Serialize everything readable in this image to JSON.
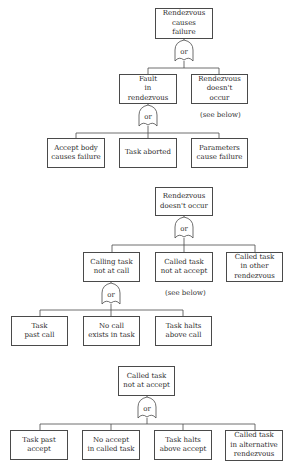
{
  "trees": [
    {
      "id": "rendezvous-causes-failure",
      "root": {
        "lines": [
          "Rendezvous",
          "causes",
          "failure"
        ]
      },
      "gate": {
        "type": "or",
        "label": "or"
      },
      "children": [
        {
          "lines": [
            "Fault",
            "in",
            "rendezvous"
          ],
          "gate": {
            "type": "or",
            "label": "or"
          },
          "children": [
            {
              "lines": [
                "Accept body",
                "causes failure"
              ]
            },
            {
              "lines": [
                "Task aborted"
              ]
            },
            {
              "lines": [
                "Parameters",
                "cause failure"
              ]
            }
          ]
        },
        {
          "lines": [
            "Rendezvous",
            "doesn't",
            "occur"
          ],
          "note": "(see below)"
        }
      ]
    },
    {
      "id": "rendezvous-doesnt-occur",
      "root": {
        "lines": [
          "Rendezvous",
          "doesn't occur"
        ]
      },
      "gate": {
        "type": "or",
        "label": "or"
      },
      "children": [
        {
          "lines": [
            "Calling task",
            "not at call"
          ],
          "gate": {
            "type": "or",
            "label": "or"
          },
          "children": [
            {
              "lines": [
                "Task",
                "past call"
              ]
            },
            {
              "lines": [
                "No call",
                "exists in task"
              ]
            },
            {
              "lines": [
                "Task halts",
                "above call"
              ]
            }
          ]
        },
        {
          "lines": [
            "Called task",
            "not at accept"
          ],
          "note": "(see below)"
        },
        {
          "lines": [
            "Called task",
            "in other",
            "rendezvous"
          ]
        }
      ]
    },
    {
      "id": "called-task-not-at-accept",
      "root": {
        "lines": [
          "Called task",
          "not at accept"
        ]
      },
      "gate": {
        "type": "or",
        "label": "or"
      },
      "children": [
        {
          "lines": [
            "Task past",
            "accept"
          ]
        },
        {
          "lines": [
            "No accept",
            "in called task"
          ]
        },
        {
          "lines": [
            "Task halts",
            "above accept"
          ]
        },
        {
          "lines": [
            "Called task",
            "in alternative",
            "rendezvous"
          ]
        }
      ]
    }
  ],
  "colors": {
    "line": "#4a4a4a",
    "text": "#2a2a2a",
    "background": "#ffffff"
  }
}
